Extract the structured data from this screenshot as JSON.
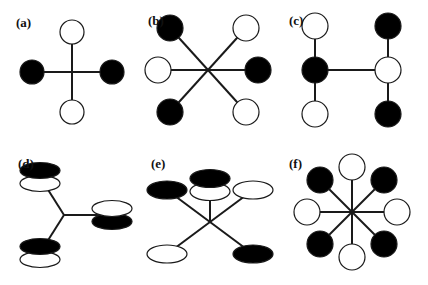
{
  "figure": {
    "name": "coordination-polyhedra-schematics",
    "width": 428,
    "height": 285,
    "background": "#ffffff",
    "stroke_color": "#1a1a1a",
    "filled_color": "#000000",
    "open_color": "#ffffff",
    "bond_width": 2.0,
    "node_stroke_width": 1.2
  },
  "panels": [
    {
      "id": "a",
      "label": "(a)",
      "label_x": 16,
      "label_y": 16,
      "origin_x": 0,
      "origin_y": 0,
      "center": {
        "x": 72,
        "y": 72
      },
      "node_shape": "circle",
      "node_r": 12,
      "bonds": [
        {
          "x1": 72,
          "y1": 72,
          "x2": 72,
          "y2": 32
        },
        {
          "x1": 72,
          "y1": 72,
          "x2": 72,
          "y2": 112
        },
        {
          "x1": 72,
          "y1": 72,
          "x2": 32,
          "y2": 72
        },
        {
          "x1": 72,
          "y1": 72,
          "x2": 112,
          "y2": 72
        }
      ],
      "nodes": [
        {
          "name": "node-top",
          "x": 72,
          "y": 32,
          "fill": "open"
        },
        {
          "name": "node-bottom",
          "x": 72,
          "y": 112,
          "fill": "open"
        },
        {
          "name": "node-left",
          "x": 32,
          "y": 72,
          "fill": "filled"
        },
        {
          "name": "node-right",
          "x": 112,
          "y": 72,
          "fill": "filled"
        }
      ]
    },
    {
      "id": "b",
      "label": "(b)",
      "label_x": 8,
      "label_y": 14,
      "origin_x": 140,
      "origin_y": 0,
      "center": {
        "x": 68,
        "y": 70
      },
      "node_shape": "circle",
      "node_r": 13,
      "bonds": [
        {
          "x1": 68,
          "y1": 70,
          "x2": 30,
          "y2": 28
        },
        {
          "x1": 68,
          "y1": 70,
          "x2": 106,
          "y2": 28
        },
        {
          "x1": 68,
          "y1": 70,
          "x2": 118,
          "y2": 70
        },
        {
          "x1": 68,
          "y1": 70,
          "x2": 106,
          "y2": 112
        },
        {
          "x1": 68,
          "y1": 70,
          "x2": 30,
          "y2": 112
        },
        {
          "x1": 68,
          "y1": 70,
          "x2": 18,
          "y2": 70
        }
      ],
      "nodes": [
        {
          "name": "node-upper-left",
          "x": 30,
          "y": 28,
          "fill": "filled"
        },
        {
          "name": "node-upper-right",
          "x": 106,
          "y": 28,
          "fill": "open"
        },
        {
          "name": "node-right",
          "x": 118,
          "y": 70,
          "fill": "filled"
        },
        {
          "name": "node-lower-right",
          "x": 106,
          "y": 112,
          "fill": "open"
        },
        {
          "name": "node-lower-left",
          "x": 30,
          "y": 112,
          "fill": "filled"
        },
        {
          "name": "node-left",
          "x": 18,
          "y": 70,
          "fill": "open"
        }
      ]
    },
    {
      "id": "c",
      "label": "(c)",
      "label_x": 4,
      "label_y": 14,
      "origin_x": 285,
      "origin_y": 0,
      "center": {
        "x": 30,
        "y": 70
      },
      "node_shape": "circle",
      "node_r": 13,
      "bonds": [
        {
          "x1": 30,
          "y1": 70,
          "x2": 30,
          "y2": 26
        },
        {
          "x1": 30,
          "y1": 70,
          "x2": 30,
          "y2": 114
        },
        {
          "x1": 30,
          "y1": 70,
          "x2": 103,
          "y2": 70
        },
        {
          "x1": 103,
          "y1": 70,
          "x2": 103,
          "y2": 26
        },
        {
          "x1": 103,
          "y1": 70,
          "x2": 103,
          "y2": 114
        }
      ],
      "nodes": [
        {
          "name": "node-left-top",
          "x": 30,
          "y": 26,
          "fill": "open"
        },
        {
          "name": "node-left-center",
          "x": 30,
          "y": 70,
          "fill": "filled"
        },
        {
          "name": "node-left-bottom",
          "x": 30,
          "y": 114,
          "fill": "open"
        },
        {
          "name": "node-right-top",
          "x": 103,
          "y": 26,
          "fill": "filled"
        },
        {
          "name": "node-right-center",
          "x": 103,
          "y": 70,
          "fill": "open"
        },
        {
          "name": "node-right-bottom",
          "x": 103,
          "y": 114,
          "fill": "filled"
        }
      ]
    },
    {
      "id": "d",
      "label": "(d)",
      "label_x": 18,
      "label_y": 14,
      "origin_x": 0,
      "origin_y": 143,
      "center": {
        "x": 64,
        "y": 72
      },
      "node_shape": "ellipse-pair",
      "node_rx": 20,
      "node_ry": 8,
      "pair_gap": 13,
      "bonds": [
        {
          "x1": 64,
          "y1": 72,
          "x2": 40,
          "y2": 34
        },
        {
          "x1": 64,
          "y1": 72,
          "x2": 40,
          "y2": 110
        },
        {
          "x1": 64,
          "y1": 72,
          "x2": 112,
          "y2": 72
        }
      ],
      "nodes": [
        {
          "name": "node-upper-left",
          "x": 40,
          "y": 34,
          "order": "filled-over-open"
        },
        {
          "name": "node-lower-left",
          "x": 40,
          "y": 110,
          "order": "filled-over-open"
        },
        {
          "name": "node-right",
          "x": 112,
          "y": 72,
          "order": "open-over-filled"
        }
      ]
    },
    {
      "id": "e",
      "label": "(e)",
      "label_x": 8,
      "label_y": 14,
      "origin_x": 143,
      "origin_y": 143,
      "center": {
        "x": 67,
        "y": 79
      },
      "node_shape": "ellipse",
      "node_rx": 20,
      "node_ry": 9,
      "pair_gap": 13,
      "bonds": [
        {
          "x1": 67,
          "y1": 79,
          "x2": 24,
          "y2": 47
        },
        {
          "x1": 67,
          "y1": 79,
          "x2": 110,
          "y2": 47
        },
        {
          "x1": 67,
          "y1": 79,
          "x2": 24,
          "y2": 111
        },
        {
          "x1": 67,
          "y1": 79,
          "x2": 110,
          "y2": 111
        },
        {
          "x1": 67,
          "y1": 79,
          "x2": 67,
          "y2": 42
        }
      ],
      "nodes": [
        {
          "name": "node-upper-left",
          "x": 24,
          "y": 47,
          "fill": "filled",
          "shape": "ellipse"
        },
        {
          "name": "node-upper-right",
          "x": 110,
          "y": 47,
          "fill": "open",
          "shape": "ellipse"
        },
        {
          "name": "node-lower-left",
          "x": 24,
          "y": 111,
          "fill": "open",
          "shape": "ellipse"
        },
        {
          "name": "node-lower-right",
          "x": 110,
          "y": 111,
          "fill": "filled",
          "shape": "ellipse"
        },
        {
          "name": "node-axial-top",
          "x": 67,
          "y": 42,
          "order": "filled-over-open",
          "shape": "ellipse-pair"
        }
      ]
    },
    {
      "id": "f",
      "label": "(f)",
      "label_x": 4,
      "label_y": 14,
      "origin_x": 285,
      "origin_y": 143,
      "center": {
        "x": 67,
        "y": 69
      },
      "node_shape": "circle",
      "node_r": 13,
      "bonds": [
        {
          "x1": 67,
          "y1": 69,
          "x2": 67,
          "y2": 24
        },
        {
          "x1": 67,
          "y1": 69,
          "x2": 99,
          "y2": 37
        },
        {
          "x1": 67,
          "y1": 69,
          "x2": 112,
          "y2": 69
        },
        {
          "x1": 67,
          "y1": 69,
          "x2": 99,
          "y2": 101
        },
        {
          "x1": 67,
          "y1": 69,
          "x2": 67,
          "y2": 114
        },
        {
          "x1": 67,
          "y1": 69,
          "x2": 35,
          "y2": 101
        },
        {
          "x1": 67,
          "y1": 69,
          "x2": 22,
          "y2": 69
        },
        {
          "x1": 67,
          "y1": 69,
          "x2": 35,
          "y2": 37
        }
      ],
      "nodes": [
        {
          "name": "node-top",
          "x": 67,
          "y": 24,
          "fill": "open"
        },
        {
          "name": "node-upper-right",
          "x": 99,
          "y": 37,
          "fill": "filled"
        },
        {
          "name": "node-right",
          "x": 112,
          "y": 69,
          "fill": "open"
        },
        {
          "name": "node-lower-right",
          "x": 99,
          "y": 101,
          "fill": "filled"
        },
        {
          "name": "node-bottom",
          "x": 67,
          "y": 114,
          "fill": "open"
        },
        {
          "name": "node-lower-left",
          "x": 35,
          "y": 101,
          "fill": "filled"
        },
        {
          "name": "node-left",
          "x": 22,
          "y": 69,
          "fill": "open"
        },
        {
          "name": "node-upper-left",
          "x": 35,
          "y": 37,
          "fill": "filled"
        }
      ]
    }
  ]
}
